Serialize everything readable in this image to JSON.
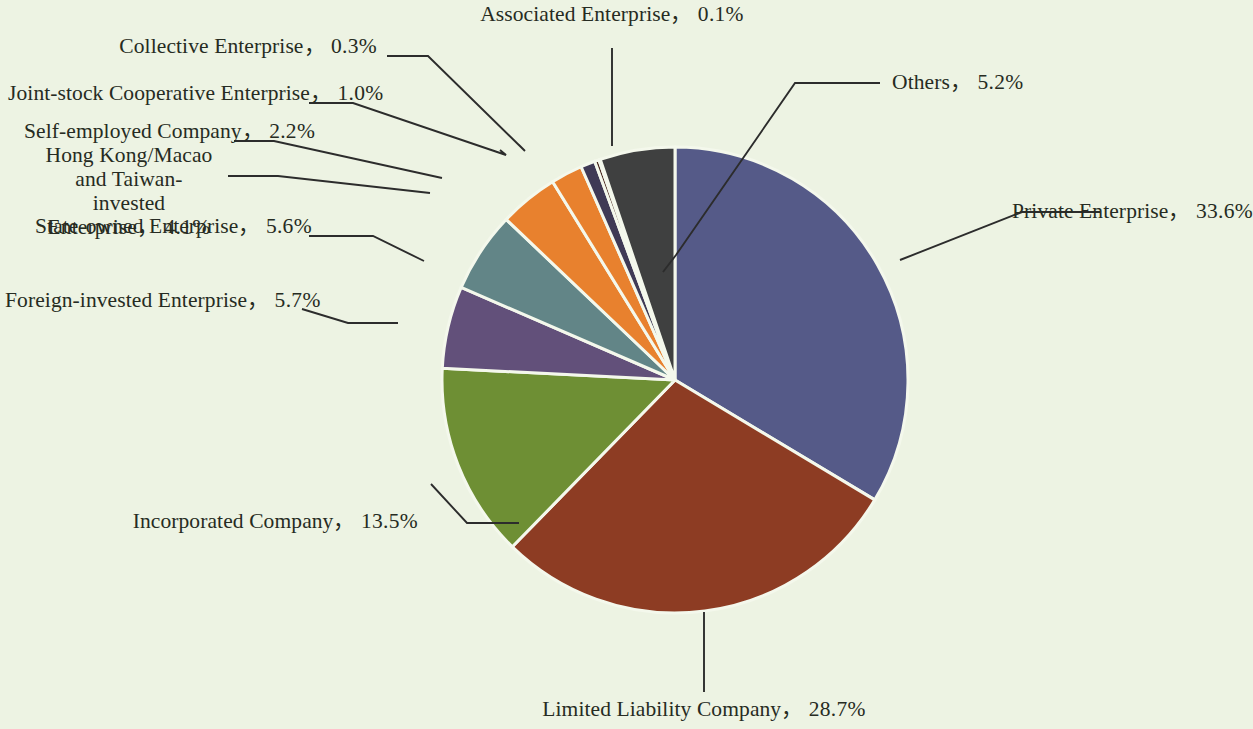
{
  "figure": {
    "background_color": "#edf3e3",
    "text_color": "#262b22",
    "leader_color": "#2c2c2c",
    "slice_border_color": "#f4f8ec"
  },
  "chart_data": {
    "type": "pie",
    "title": "",
    "subtitle": "",
    "xlabel": "",
    "ylabel": "",
    "units": "percent",
    "legend_position": "none",
    "labels_position": "outside-with-leader-lines",
    "grid": false,
    "start_angle_deg": 0,
    "direction": "clockwise",
    "total": 100.0,
    "categories": [
      "Private Enterprise",
      "Limited Liability Company",
      "Incorporated Company",
      "Foreign-invested Enterprise",
      "State-owned Enterprise",
      "Hong Kong/Macao and Taiwan-invested Enterprise",
      "Self-employed Company",
      "Joint-stock Cooperative Enterprise",
      "Collective Enterprise",
      "Associated Enterprise",
      "Others"
    ],
    "values": [
      33.6,
      28.7,
      13.5,
      5.7,
      5.6,
      4.1,
      2.2,
      1.0,
      0.3,
      0.1,
      5.2
    ],
    "value_strings": [
      "33.6%",
      "28.7%",
      "13.5%",
      "5.7%",
      "5.6%",
      "4.1%",
      "2.2%",
      "1.0%",
      "0.3%",
      "0.1%",
      "5.2%"
    ],
    "colors": [
      "#555a88",
      "#8d3c23",
      "#6e8f34",
      "#62507a",
      "#628587",
      "#e8812e",
      "#e8812e",
      "#3f3a55",
      "#45231a",
      "#45231a",
      "#3f4040"
    ]
  },
  "labels": {
    "private_enterprise": {
      "name": "Private Enterprise",
      "separator": "，",
      "value": "33.6%"
    },
    "limited_liability": {
      "name": "Limited Liability Company",
      "separator": "，",
      "value": "28.7%"
    },
    "incorporated": {
      "name": "Incorporated Company",
      "separator": "，",
      "value": "13.5%"
    },
    "foreign_invested": {
      "name": "Foreign-invested Enterprise",
      "separator": "，",
      "value": "5.7%"
    },
    "state_owned": {
      "name": "State-owned Enterprise",
      "separator": "，",
      "value": "5.6%"
    },
    "hk_macao_taiwan": {
      "name_line1": "Hong Kong/Macao and Taiwan-",
      "name_line2": "invested Enterprise",
      "separator": "，",
      "value": "4.1%"
    },
    "self_employed": {
      "name": "Self-employed Company",
      "separator": "，",
      "value": "2.2%"
    },
    "joint_stock": {
      "name": "Joint-stock Cooperative Enterprise",
      "separator": "，",
      "value": "1.0%"
    },
    "collective": {
      "name": "Collective Enterprise",
      "separator": "，",
      "value": "0.3%"
    },
    "associated": {
      "name": "Associated Enterprise",
      "separator": "，",
      "value": "0.1%"
    },
    "others": {
      "name": "Others",
      "separator": "，",
      "value": "5.2%"
    }
  }
}
